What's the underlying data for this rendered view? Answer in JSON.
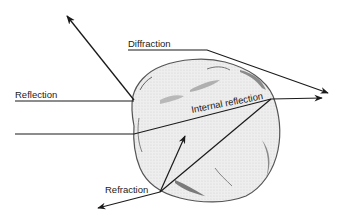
{
  "diagram": {
    "type": "light-particle interaction",
    "labels": {
      "reflection": "Reflection",
      "diffraction": "Diffraction",
      "internal_reflection": "Internal reflection",
      "refraction": "Refraction"
    },
    "colors": {
      "line": "#1a1a1a",
      "particle_fill": "#ececec",
      "particle_edge": "#555555",
      "shade": "#9a9a9a"
    }
  }
}
